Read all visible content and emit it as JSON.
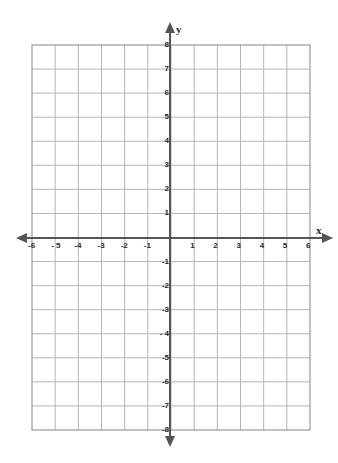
{
  "worksheet": {
    "type": "coordinate-plane",
    "grid": {
      "x_min": -6,
      "x_max": 6,
      "y_min": -8,
      "y_max": 8,
      "step": 1,
      "line_color": "#b5b5b5",
      "border_color": "#9a9a9a"
    },
    "axes": {
      "color": "#555555",
      "x_label": "x",
      "y_label": "y",
      "x_ticks": [
        "-6",
        "- 5",
        "-4",
        "-3",
        "-2",
        "-1",
        "1",
        "2",
        "3",
        "4",
        "5",
        "6"
      ],
      "y_ticks": [
        "8",
        "7",
        "6",
        "5",
        "4",
        "3",
        "2",
        "1",
        "-1",
        "-2",
        "-3",
        "- 4",
        "-5",
        "-6",
        "-7",
        "-8"
      ]
    }
  }
}
